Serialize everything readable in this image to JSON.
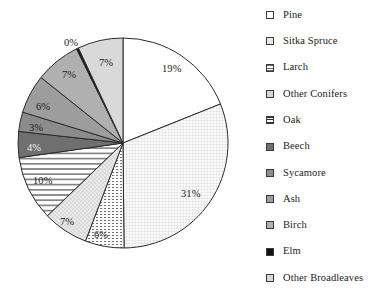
{
  "chart_data": {
    "type": "pie",
    "title": "",
    "subtitle": "",
    "xlabel": "",
    "ylabel": "",
    "grid": false,
    "legend_position": "right",
    "start_angle_deg": 0,
    "direction": "clockwise",
    "units": "percent",
    "categories": [
      "Pine",
      "Sitka Spruce",
      "Larch",
      "Other Conifers",
      "Oak",
      "Beech",
      "Sycamore",
      "Ash",
      "Birch",
      "Elm",
      "Other Broadleaves"
    ],
    "values": [
      19,
      31,
      6,
      7,
      10,
      4,
      3,
      6,
      7,
      0,
      7
    ],
    "data_labels": [
      "19%",
      "31%",
      "6%",
      "7%",
      "10%",
      "4%",
      "3%",
      "6%",
      "7%",
      "0%",
      "7%"
    ],
    "slices": [
      {
        "label": "Pine",
        "value": 19,
        "data_label": "19%",
        "fill": "#ffffff",
        "pattern": "solid",
        "label_x": 162,
        "label_y": 64,
        "label_color": "#1c1c1c"
      },
      {
        "label": "Sitka Spruce",
        "value": 31,
        "data_label": "31%",
        "fill": "#f2f2f2",
        "pattern": "fine-grid",
        "label_x": 181,
        "label_y": 189,
        "label_color": "#1c1c1c"
      },
      {
        "label": "Larch",
        "value": 6,
        "data_label": "6%",
        "fill": "#ededed",
        "pattern": "dash-rows",
        "label_x": 94,
        "label_y": 230,
        "label_color": "#1c1c1c"
      },
      {
        "label": "Other Conifers",
        "value": 7,
        "data_label": "7%",
        "fill": "#e4e4e4",
        "pattern": "sparse-dots",
        "label_x": 60,
        "label_y": 217,
        "label_color": "#1c1c1c"
      },
      {
        "label": "Oak",
        "value": 10,
        "data_label": "10%",
        "fill": "#ffffff",
        "pattern": "horizontal-lines",
        "label_x": 33,
        "label_y": 176,
        "label_color": "#1c1c1c"
      },
      {
        "label": "Beech",
        "value": 4,
        "data_label": "4%",
        "fill": "#6f6f6f",
        "pattern": "solid",
        "label_x": 27,
        "label_y": 143,
        "label_color": "#f0f0f0"
      },
      {
        "label": "Sycamore",
        "value": 3,
        "data_label": "3%",
        "fill": "#8c8c8c",
        "pattern": "solid",
        "label_x": 29,
        "label_y": 123,
        "label_color": "#1c1c1c"
      },
      {
        "label": "Ash",
        "value": 6,
        "data_label": "6%",
        "fill": "#9d9d9d",
        "pattern": "solid",
        "label_x": 36,
        "label_y": 102,
        "label_color": "#1c1c1c"
      },
      {
        "label": "Birch",
        "value": 7,
        "data_label": "7%",
        "fill": "#b0b0b0",
        "pattern": "solid",
        "label_x": 62,
        "label_y": 70,
        "label_color": "#1c1c1c"
      },
      {
        "label": "Elm",
        "value": 0,
        "data_label": "0%",
        "fill": "#111111",
        "pattern": "solid",
        "label_x": 64,
        "label_y": 38,
        "label_color": "#1c1c1c"
      },
      {
        "label": "Other Broadleaves",
        "value": 7,
        "data_label": "7%",
        "fill": "#d9d9d9",
        "pattern": "solid",
        "label_x": 99,
        "label_y": 58,
        "label_color": "#1c1c1c"
      }
    ]
  },
  "legend": {
    "items": [
      {
        "label": "Pine",
        "swatch": "swatch-pine"
      },
      {
        "label": "Sitka Spruce",
        "swatch": "swatch-sitka-spruce"
      },
      {
        "label": "Larch",
        "swatch": "swatch-larch"
      },
      {
        "label": "Other Conifers",
        "swatch": "swatch-other-conifers"
      },
      {
        "label": "Oak",
        "swatch": "swatch-oak"
      },
      {
        "label": "Beech",
        "swatch": "swatch-beech"
      },
      {
        "label": "Sycamore",
        "swatch": "swatch-sycamore"
      },
      {
        "label": "Ash",
        "swatch": "swatch-ash"
      },
      {
        "label": "Birch",
        "swatch": "swatch-birch"
      },
      {
        "label": "Elm",
        "swatch": "swatch-elm"
      },
      {
        "label": "Other Broadleaves",
        "swatch": "swatch-other-broadleaves"
      }
    ]
  },
  "geometry": {
    "center_x": 123,
    "center_y": 143,
    "radius": 105,
    "legend_left": 266,
    "legend_first_row_y": 8,
    "legend_row_spacing": 26.3
  },
  "colors": {
    "outline": "#2a2a2a",
    "background": "#ffffff",
    "text": "#1c1c1c"
  }
}
